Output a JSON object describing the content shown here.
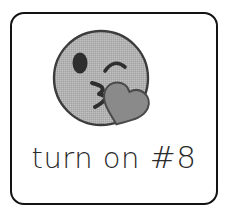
{
  "card": {
    "border_color": "#131313",
    "background_color": "#ffffff",
    "corner_radius_px": 14
  },
  "emoji": {
    "name": "face-blowing-a-kiss",
    "face_fill": "#b0b0b0",
    "face_outline": "#3c3c3c",
    "eye_color": "#2e2e2e",
    "mouth_color": "#2e2e2e",
    "heart_fill": "#8a8a8a",
    "heart_outline": "#4a4a4a",
    "left_eye": "open-oval",
    "right_eye": "winking-arc",
    "mouth": "puckered-lips",
    "accessory": "heart"
  },
  "caption": {
    "text": "turn on #8",
    "prefix": "turn on ",
    "hash_part": "#8",
    "color": "#2b2b2b"
  }
}
